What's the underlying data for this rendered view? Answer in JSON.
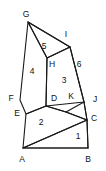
{
  "figure": {
    "name": "geometric-solid-diagram",
    "background_color": "#ffffff",
    "stroke_color": "#1a1a1a",
    "text_color": "#111111",
    "width": 106,
    "height": 171,
    "vertex_labels": [
      {
        "id": "G",
        "text": "G",
        "x": 26,
        "y": 14
      },
      {
        "id": "I",
        "text": "I",
        "x": 66,
        "y": 34
      },
      {
        "id": "H",
        "text": "H",
        "x": 52,
        "y": 64
      },
      {
        "id": "F",
        "text": "F",
        "x": 11,
        "y": 98
      },
      {
        "id": "E",
        "text": "E",
        "x": 17,
        "y": 113
      },
      {
        "id": "D",
        "text": "D",
        "x": 54,
        "y": 98
      },
      {
        "id": "K",
        "text": "K",
        "x": 71,
        "y": 96
      },
      {
        "id": "J",
        "text": "J",
        "x": 95,
        "y": 99
      },
      {
        "id": "C",
        "text": "C",
        "x": 94,
        "y": 118
      },
      {
        "id": "A",
        "text": "A",
        "x": 22,
        "y": 159
      },
      {
        "id": "B",
        "text": "B",
        "x": 88,
        "y": 159
      }
    ],
    "region_labels": [
      {
        "id": "region-5",
        "text": "5",
        "x": 44,
        "y": 46
      },
      {
        "id": "region-6",
        "text": "6",
        "x": 79,
        "y": 64
      },
      {
        "id": "region-4",
        "text": "4",
        "x": 32,
        "y": 71
      },
      {
        "id": "region-3",
        "text": "3",
        "x": 64,
        "y": 80
      },
      {
        "id": "region-2",
        "text": "2",
        "x": 41,
        "y": 122
      },
      {
        "id": "region-1",
        "text": "1",
        "x": 78,
        "y": 136
      }
    ],
    "paths": [
      {
        "id": "face-4-left-prism",
        "d": "M 28 22 L 20 100 L 26 114 L 46 106 L 47 58 Z"
      },
      {
        "id": "face-5-top-wedge",
        "d": "M 28 22 L 70 47 L 47 58 Z"
      },
      {
        "id": "edge-G-to-I-top",
        "d": "M 28 22 L 70 47"
      },
      {
        "id": "face-3-right",
        "d": "M 47 58 L 70 47 L 84 102 L 46 106 Z"
      },
      {
        "id": "face-6-outer-right",
        "d": "M 70 47 L 84 102 L 87 120 L 66 112"
      },
      {
        "id": "edge-J-to-C",
        "d": "M 84 102 L 87 120"
      },
      {
        "id": "face-2-base-slab",
        "d": "M 26 114 L 46 106 L 66 112 L 87 120 L 23 148 Z"
      },
      {
        "id": "edge-D-K-J",
        "d": "M 46 106 L 66 112 L 84 102"
      },
      {
        "id": "face-1-bottom",
        "d": "M 23 148 L 87 120 L 88 148 Z"
      },
      {
        "id": "edge-A-to-B",
        "d": "M 23 148 L 88 148"
      },
      {
        "id": "edge-C-to-B",
        "d": "M 87 120 L 88 148"
      }
    ]
  }
}
